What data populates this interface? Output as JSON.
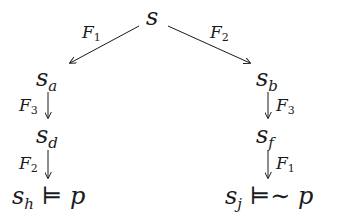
{
  "diagram": {
    "nodes": {
      "s": {
        "base": "s",
        "sub": ""
      },
      "sa": {
        "base": "s",
        "sub": "a"
      },
      "sb": {
        "base": "s",
        "sub": "b"
      },
      "sd": {
        "base": "s",
        "sub": "d"
      },
      "sf": {
        "base": "s",
        "sub": "f"
      },
      "sh": {
        "base": "s",
        "sub": "h",
        "relation": "⊨",
        "formula": "p"
      },
      "sj": {
        "base": "s",
        "sub": "j",
        "relation": "⊨∼",
        "formula": "p"
      }
    },
    "edges": [
      {
        "from": "s",
        "to": "sa",
        "label": "F",
        "label_sub": "1"
      },
      {
        "from": "s",
        "to": "sb",
        "label": "F",
        "label_sub": "2"
      },
      {
        "from": "sa",
        "to": "sd",
        "label": "F",
        "label_sub": "3"
      },
      {
        "from": "sd",
        "to": "sh",
        "label": "F",
        "label_sub": "2"
      },
      {
        "from": "sb",
        "to": "sf",
        "label": "F",
        "label_sub": "3"
      },
      {
        "from": "sf",
        "to": "sj",
        "label": "F",
        "label_sub": "1"
      }
    ]
  }
}
